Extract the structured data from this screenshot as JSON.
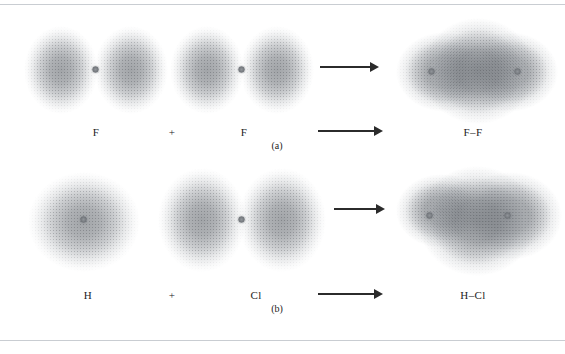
{
  "figure": {
    "background_color": "#ffffff",
    "rule_color": "#c9cdd2",
    "cloud_color": "#84888d",
    "nucleus_color": "#7d8186",
    "arrow_color": "#2b2b2b",
    "width": 565,
    "height": 354
  },
  "panels": [
    {
      "id": "panel-a",
      "caption": "(a)",
      "reaction": "F + F → F–F",
      "reactants": [
        {
          "label": "F",
          "orbital_shape": "dumbbell",
          "nuclei": 1
        },
        {
          "label": "F",
          "orbital_shape": "dumbbell",
          "nuclei": 1
        }
      ],
      "operator": "+",
      "product": {
        "label": "F–F",
        "orbital_shape": "merged-diamond",
        "nuclei": 2
      }
    },
    {
      "id": "panel-b",
      "caption": "(b)",
      "reaction": "H + Cl → H–Cl",
      "reactants": [
        {
          "label": "H",
          "orbital_shape": "sphere",
          "nuclei": 1
        },
        {
          "label": "Cl",
          "orbital_shape": "dumbbell",
          "nuclei": 1
        }
      ],
      "operator": "+",
      "product": {
        "label": "H–Cl",
        "orbital_shape": "merged-asymmetric",
        "nuclei": 2
      }
    }
  ],
  "labels": {
    "a_reactant1": "F",
    "a_plus": "+",
    "a_reactant2": "F",
    "a_product": "F–F",
    "a_caption": "(a)",
    "b_reactant1": "H",
    "b_plus": "+",
    "b_reactant2": "Cl",
    "b_product": "H–Cl",
    "b_caption": "(b)"
  },
  "arrows": {
    "a_upper": "reaction-arrow",
    "a_lower": "reaction-arrow",
    "b_upper": "reaction-arrow",
    "b_lower": "reaction-arrow"
  }
}
